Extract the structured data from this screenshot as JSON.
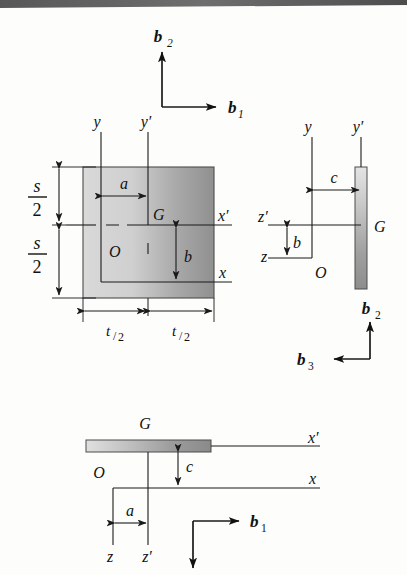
{
  "figure": {
    "name": "three-view-engineering-diagram",
    "background_color": "#fdfdfb",
    "line_color": "#1a1a1a",
    "shading": {
      "square_plate_light": "#d8d8d8",
      "square_plate_dark": "#8f8f8f",
      "thin_plate_light": "#e2e2e2",
      "thin_plate_dark": "#8a8a8a"
    },
    "scan_artifact_band": true
  },
  "basis_top": {
    "b1_label": "b",
    "b1_sub": "1",
    "b2_label": "b",
    "b2_sub": "2",
    "b1_direction": "right",
    "b2_direction": "up"
  },
  "basis_right": {
    "b2_label": "b",
    "b2_sub": "2",
    "b3_label": "b",
    "b3_sub": "3",
    "b2_direction": "up",
    "b3_direction": "left"
  },
  "basis_bottom": {
    "b1_label": "b",
    "b1_sub": "1",
    "b1_direction": "right",
    "down_arrow_direction": "down",
    "down_arrow_label": ""
  },
  "front_view": {
    "title": "front-view-square-plate",
    "axis_labels": {
      "y": "y",
      "y_prime": "y′",
      "x": "x",
      "x_prime": "x′",
      "origin": "O",
      "centroid": "G"
    },
    "dimensions": [
      {
        "name": "s-over-2-upper",
        "numerator": "s",
        "denominator": "2"
      },
      {
        "name": "s-over-2-lower",
        "numerator": "s",
        "denominator": "2"
      },
      {
        "name": "t-over-2-left",
        "numerator": "t",
        "denominator": "2"
      },
      {
        "name": "t-over-2-right",
        "numerator": "t",
        "denominator": "2"
      },
      {
        "name": "a-dimension",
        "label": "a"
      },
      {
        "name": "b-dimension",
        "label": "b"
      }
    ]
  },
  "side_view": {
    "title": "side-view-thin-plate",
    "axis_labels": {
      "y": "y",
      "y_prime": "y′",
      "z": "z",
      "z_prime": "z′",
      "origin": "O",
      "centroid": "G"
    },
    "dimensions": [
      {
        "name": "c-dimension",
        "label": "c"
      },
      {
        "name": "b-dimension",
        "label": "b"
      }
    ]
  },
  "top_view": {
    "title": "top-view-thin-plate",
    "axis_labels": {
      "x": "x",
      "x_prime": "x′",
      "z": "z",
      "z_prime": "z′",
      "origin": "O",
      "centroid": "G"
    },
    "dimensions": [
      {
        "name": "c-dimension",
        "label": "c"
      },
      {
        "name": "a-dimension",
        "label": "a"
      }
    ]
  }
}
